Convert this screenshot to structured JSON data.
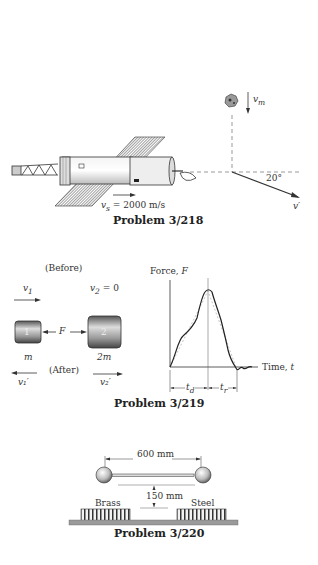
{
  "problems": [
    {
      "id": "3/218",
      "caption": "Problem 3/218",
      "labels": {
        "meteor_velocity": "v",
        "meteor_velocity_sub": "m",
        "satellite_velocity": "v",
        "satellite_velocity_sub": "s",
        "satellite_velocity_value": " = 2000 m/s",
        "angle": "20°",
        "result_velocity": "v′"
      }
    },
    {
      "id": "3/219",
      "caption": "Problem 3/219",
      "labels": {
        "before": "(Before)",
        "after": "(After)",
        "v1": "v",
        "v1_sub": "1",
        "v2": "v",
        "v2_sub": "2",
        "v2_value": " = 0",
        "v1_prime": "v₁′",
        "v2_prime": "v₂′",
        "body1": "1",
        "body2": "2",
        "force": "F",
        "mass1": "m",
        "mass2": "2m",
        "y_axis": "Force, ",
        "y_axis_var": "F",
        "x_axis": "Time, ",
        "x_axis_var": "t",
        "td": "t",
        "td_sub": "d",
        "tr": "t",
        "tr_sub": "r"
      }
    },
    {
      "id": "3/220",
      "caption": "Problem 3/220",
      "labels": {
        "length": "600 mm",
        "height": "150 mm",
        "left_block": "Brass",
        "right_block": "Steel"
      }
    }
  ]
}
